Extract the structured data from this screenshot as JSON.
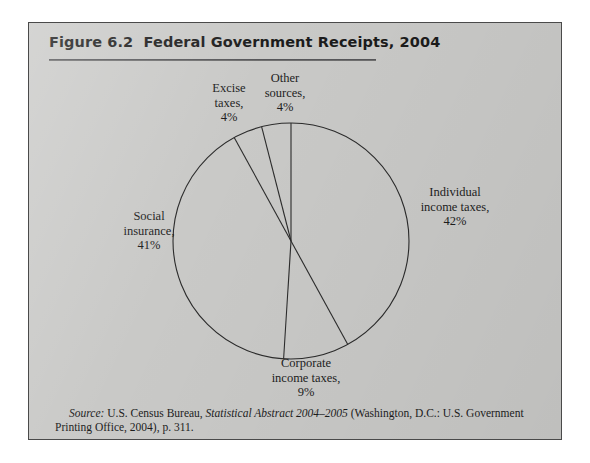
{
  "figure": {
    "title": "Figure 6.2  Federal Government Receipts, 2004",
    "panel_color": "#c9c9c7",
    "border_color": "#4a4a4a",
    "rule_color": "#6f6f6f"
  },
  "labels": {
    "excise": "Excise\ntaxes,\n4%",
    "other": "Other\nsources,\n4%",
    "individual": "Individual\nincome taxes,\n42%",
    "social": "Social\ninsurance,\n41%",
    "corporate": "Corporate\nincome taxes,\n9%"
  },
  "source": {
    "prefix": "Source:",
    "body_1": " U.S. Census Bureau, ",
    "italic_title": "Statistical Abstract 2004–2005",
    "body_2": " (Washington, D.C.: U.S. Government Printing Office, 2004), p. 311."
  },
  "chart_data": {
    "type": "pie",
    "title": "Figure 6.2  Federal Government Receipts, 2004",
    "subtitle": "",
    "xlabel": "",
    "ylabel": "",
    "unit": "percent",
    "start_angle_deg": 0,
    "direction": "clockwise",
    "legend": "none (direct labels around pie)",
    "grid": false,
    "categories": [
      "Individual income taxes",
      "Corporate income taxes",
      "Social insurance",
      "Excise taxes",
      "Other sources"
    ],
    "values": [
      42,
      9,
      41,
      4,
      4
    ],
    "labels": [
      "Individual income taxes, 42%",
      "Corporate income taxes, 9%",
      "Social insurance, 41%",
      "Excise taxes, 4%",
      "Other sources, 4%"
    ],
    "slice_color": "#c9c9c7",
    "slice_edge_color": "#2b2b2b",
    "total": 100,
    "annotations": [
      "Source: U.S. Census Bureau, Statistical Abstract 2004–2005 (Washington, D.C.: U.S. Government Printing Office, 2004), p. 311."
    ]
  }
}
